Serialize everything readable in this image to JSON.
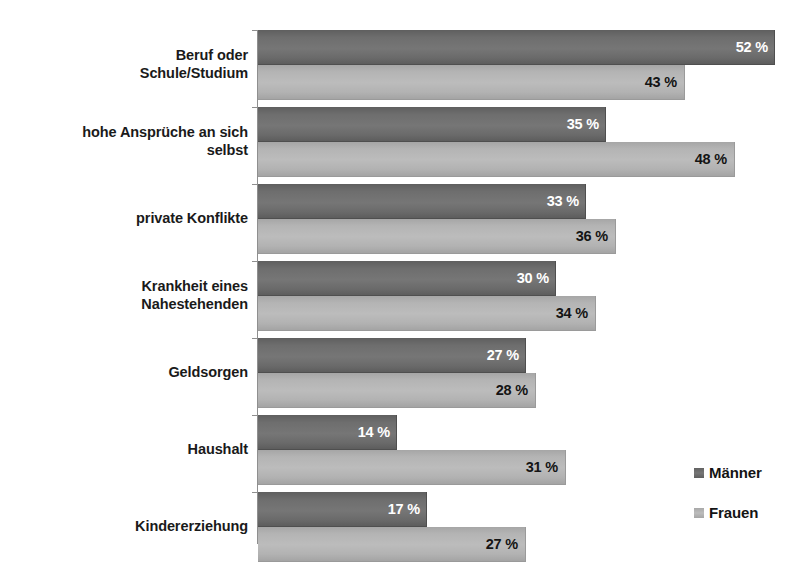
{
  "chart_data": {
    "type": "bar",
    "orientation": "horizontal",
    "title": "",
    "subtitle": "",
    "xlabel": "",
    "ylabel": "",
    "xlim": [
      0,
      55
    ],
    "grid": false,
    "legend_position": "right-bottom",
    "value_suffix": " %",
    "categories": [
      "Beruf oder\nSchule/Studium",
      "hohe Ansprüche an sich\nselbst",
      "private Konflikte",
      "Krankheit eines\nNahestehenden",
      "Geldsorgen",
      "Haushalt",
      "Kindererziehung"
    ],
    "series": [
      {
        "name": "Männer",
        "color": "#6e6e6e",
        "label_color": "#ffffff",
        "values": [
          52,
          35,
          33,
          30,
          27,
          14,
          17
        ],
        "value_labels": [
          "52 %",
          "35 %",
          "33 %",
          "30 %",
          "27 %",
          "14 %",
          "17 %"
        ]
      },
      {
        "name": "Frauen",
        "color": "#b4b4b4",
        "label_color": "#141414",
        "values": [
          43,
          48,
          36,
          34,
          28,
          31,
          27
        ],
        "value_labels": [
          "43 %",
          "48 %",
          "36 %",
          "34 %",
          "28 %",
          "31 %",
          "27 %"
        ]
      }
    ]
  },
  "categories": [
    {
      "line1": "Beruf oder",
      "line2": "Schule/Studium"
    },
    {
      "line1": "hohe Ansprüche an sich",
      "line2": "selbst"
    },
    {
      "line1": "private Konflikte",
      "line2": ""
    },
    {
      "line1": "Krankheit eines",
      "line2": "Nahestehenden"
    },
    {
      "line1": "Geldsorgen",
      "line2": ""
    },
    {
      "line1": "Haushalt",
      "line2": ""
    },
    {
      "line1": "Kindererziehung",
      "line2": ""
    }
  ],
  "legend": {
    "items": [
      {
        "label": "Männer"
      },
      {
        "label": "Frauen"
      }
    ]
  }
}
